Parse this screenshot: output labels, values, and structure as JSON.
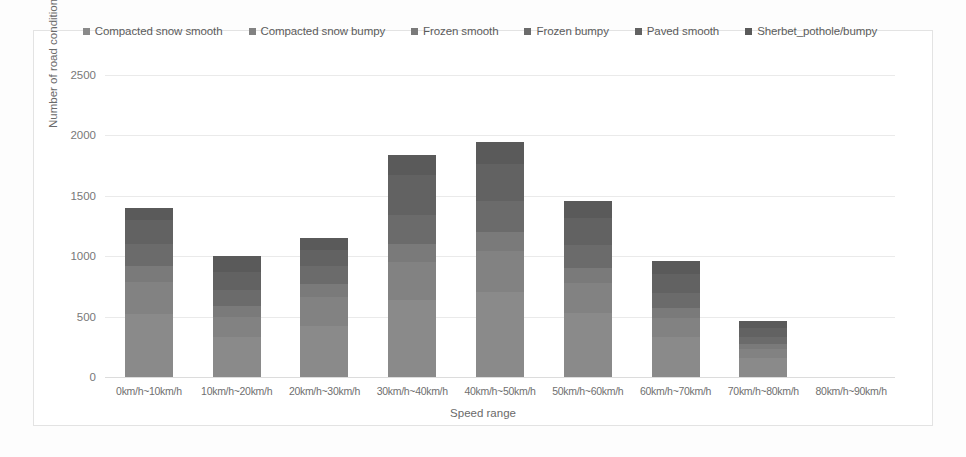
{
  "chart_data": {
    "type": "bar",
    "subtype": "stacked-bar",
    "title": "",
    "xlabel": "Speed range",
    "ylabel": "Number of road conditions",
    "ylim": [
      0,
      2500
    ],
    "yticks": [
      0,
      500,
      1000,
      1500,
      2000,
      2500
    ],
    "grid": true,
    "legend_position": "top",
    "categories": [
      "0km/h~10km/h",
      "10km/h~20km/h",
      "20km/h~30km/h",
      "30km/h~40km/h",
      "40km/h~50km/h",
      "50km/h~60km/h",
      "60km/h~70km/h",
      "70km/h~80km/h",
      "80km/h~90km/h"
    ],
    "series": [
      {
        "name": "Compacted snow smooth",
        "color": "#8a8a8a",
        "values": [
          520,
          330,
          420,
          640,
          700,
          530,
          330,
          160,
          0
        ]
      },
      {
        "name": "Compacted snow bumpy",
        "color": "#828282",
        "values": [
          270,
          170,
          240,
          310,
          340,
          250,
          160,
          70,
          0
        ]
      },
      {
        "name": "Frozen smooth",
        "color": "#7a7a7a",
        "values": [
          130,
          90,
          110,
          150,
          160,
          120,
          80,
          40,
          0
        ]
      },
      {
        "name": "Frozen bumpy",
        "color": "#6b6b6b",
        "values": [
          180,
          130,
          150,
          240,
          260,
          190,
          130,
          60,
          0
        ]
      },
      {
        "name": "Paved smooth",
        "color": "#626262",
        "values": [
          200,
          150,
          130,
          330,
          300,
          230,
          150,
          80,
          0
        ]
      },
      {
        "name": "Sherbet_pothole/bumpy",
        "color": "#5a5a5a",
        "values": [
          100,
          130,
          100,
          170,
          190,
          140,
          110,
          50,
          0
        ]
      }
    ],
    "totals": [
      1400,
      1000,
      1150,
      1840,
      1950,
      1460,
      960,
      460,
      0
    ]
  },
  "legend": {
    "items": [
      {
        "label": "Compacted snow smooth",
        "color": "#8a8a8a"
      },
      {
        "label": "Compacted snow bumpy",
        "color": "#828282"
      },
      {
        "label": "Frozen smooth",
        "color": "#7a7a7a"
      },
      {
        "label": "Frozen bumpy",
        "color": "#6b6b6b"
      },
      {
        "label": "Paved smooth",
        "color": "#626262"
      },
      {
        "label": "Sherbet_pothole/bumpy",
        "color": "#5a5a5a"
      }
    ]
  },
  "axes": {
    "y_title": "Number of road conditions",
    "x_title": "Speed range",
    "y_tick_labels": [
      "2500",
      "2000",
      "1500",
      "1000",
      "500",
      "0"
    ],
    "x_tick_labels": [
      "0km/h~10km/h",
      "10km/h~20km/h",
      "20km/h~30km/h",
      "30km/h~40km/h",
      "40km/h~50km/h",
      "50km/h~60km/h",
      "60km/h~70km/h",
      "70km/h~80km/h",
      "80km/h~90km/h"
    ]
  }
}
